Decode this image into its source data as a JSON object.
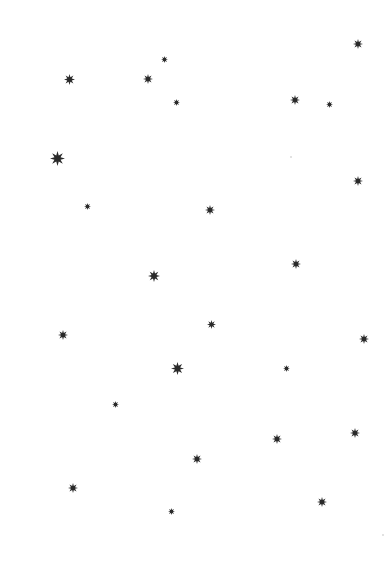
{
  "canvas": {
    "width": 388,
    "height": 577,
    "background": "#ffffff"
  },
  "star_color": "#2a2a2a",
  "stars": [
    {
      "x": 358,
      "y": 44,
      "size": 10
    },
    {
      "x": 69,
      "y": 79,
      "size": 11
    },
    {
      "x": 148,
      "y": 79,
      "size": 10
    },
    {
      "x": 164,
      "y": 59,
      "size": 7
    },
    {
      "x": 176,
      "y": 102,
      "size": 7
    },
    {
      "x": 295,
      "y": 100,
      "size": 10
    },
    {
      "x": 329,
      "y": 104,
      "size": 7
    },
    {
      "x": 57,
      "y": 158,
      "size": 15
    },
    {
      "x": 358,
      "y": 181,
      "size": 10
    },
    {
      "x": 87,
      "y": 206,
      "size": 7
    },
    {
      "x": 210,
      "y": 210,
      "size": 10
    },
    {
      "x": 296,
      "y": 264,
      "size": 10
    },
    {
      "x": 154,
      "y": 276,
      "size": 12
    },
    {
      "x": 211,
      "y": 324,
      "size": 9
    },
    {
      "x": 63,
      "y": 335,
      "size": 10
    },
    {
      "x": 364,
      "y": 339,
      "size": 10
    },
    {
      "x": 177,
      "y": 368,
      "size": 13
    },
    {
      "x": 286,
      "y": 368,
      "size": 7
    },
    {
      "x": 115,
      "y": 404,
      "size": 7
    },
    {
      "x": 355,
      "y": 433,
      "size": 10
    },
    {
      "x": 277,
      "y": 439,
      "size": 10
    },
    {
      "x": 197,
      "y": 459,
      "size": 10
    },
    {
      "x": 73,
      "y": 488,
      "size": 10
    },
    {
      "x": 322,
      "y": 502,
      "size": 10
    },
    {
      "x": 171,
      "y": 511,
      "size": 7
    }
  ],
  "faint_dots": [
    {
      "x": 291,
      "y": 157
    },
    {
      "x": 383,
      "y": 535
    }
  ]
}
